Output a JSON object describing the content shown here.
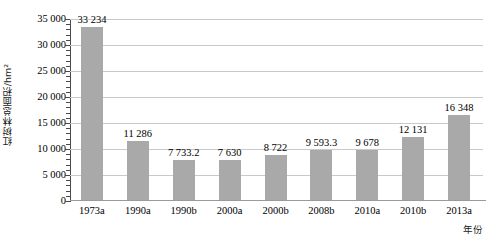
{
  "chart_data": {
    "type": "bar",
    "title": "",
    "xlabel": "年份",
    "ylabel": "红树林总面积/hm²",
    "categories": [
      "1973a",
      "1990a",
      "1990b",
      "2000a",
      "2000b",
      "2008b",
      "2010a",
      "2010b",
      "2013a"
    ],
    "values": [
      33234,
      11286,
      7733.2,
      7630,
      8722,
      9593.3,
      9678,
      12131,
      16348
    ],
    "value_labels": [
      "33 234",
      "11 286",
      "7 733.2",
      "7 630",
      "8 722",
      "9 593.3",
      "9 678",
      "12 131",
      "16 348"
    ],
    "ylim": [
      0,
      35000
    ],
    "ytick_values": [
      0,
      5000,
      10000,
      15000,
      20000,
      25000,
      30000,
      35000
    ],
    "ytick_labels": [
      "0",
      "5 000",
      "10 000",
      "15 000",
      "20 000",
      "25 000",
      "30 000",
      "35 000"
    ],
    "grid": true,
    "legend": "none",
    "series_color": "#a9a9a9",
    "gridline_color": "#c9c9c9",
    "axis_color": "#4a4a4a"
  }
}
